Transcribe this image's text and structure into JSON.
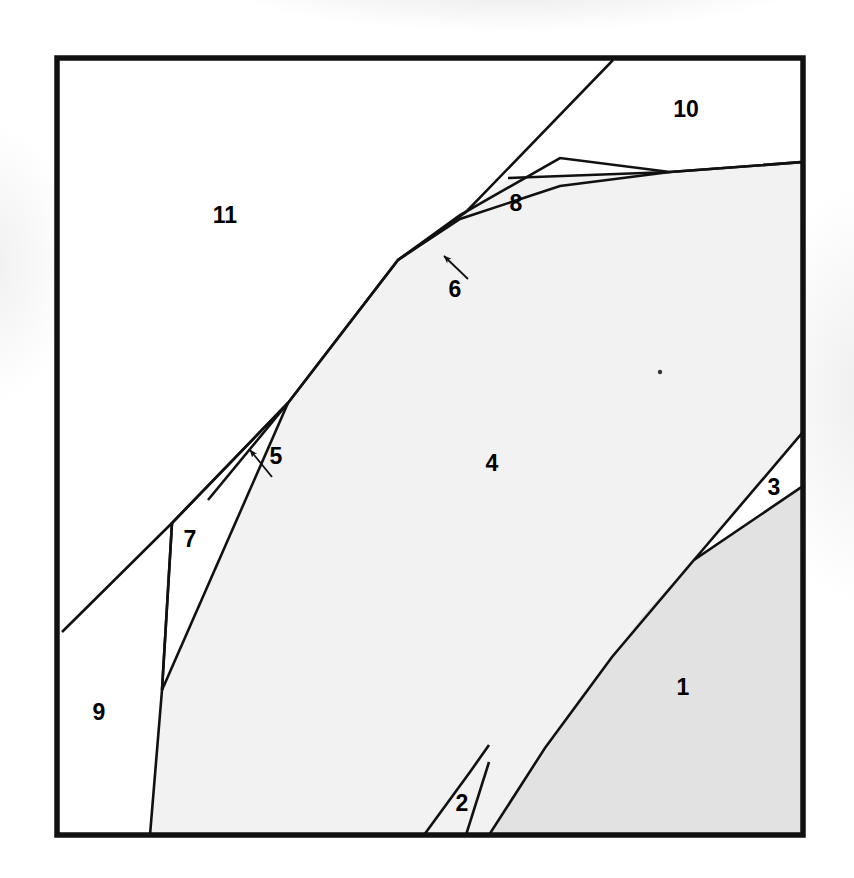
{
  "figure": {
    "type": "region-partition-diagram",
    "background_color": "#ffffff",
    "frame": {
      "x": 57,
      "y": 58,
      "width": 746,
      "height": 777,
      "stroke_color": "#111111",
      "stroke_width": 5.5
    },
    "fill_colors": {
      "white": "#ffffff",
      "light_gray": "#f2f2f2",
      "mid_gray": "#e2e2e2"
    },
    "line_color": "#111111"
  },
  "regions": [
    {
      "id": "region-1",
      "label": "1",
      "label_x": 683,
      "label_y": 689,
      "fill": "mid_gray",
      "has_leader": false
    },
    {
      "id": "region-2",
      "label": "2",
      "label_x": 462,
      "label_y": 805,
      "fill": "light_gray",
      "has_leader": false
    },
    {
      "id": "region-3",
      "label": "3",
      "label_x": 774,
      "label_y": 489,
      "fill": "white",
      "has_leader": false
    },
    {
      "id": "region-4",
      "label": "4",
      "label_x": 492,
      "label_y": 465,
      "fill": "light_gray",
      "has_leader": false
    },
    {
      "id": "region-5",
      "label": "5",
      "label_x": 272,
      "label_y": 458,
      "fill": "white",
      "has_leader": true
    },
    {
      "id": "region-6",
      "label": "6",
      "label_x": 455,
      "label_y": 290,
      "fill": "white",
      "has_leader": true
    },
    {
      "id": "region-7",
      "label": "7",
      "label_x": 190,
      "label_y": 541,
      "fill": "white",
      "has_leader": false
    },
    {
      "id": "region-8",
      "label": "8",
      "label_x": 516,
      "label_y": 205,
      "fill": "white",
      "has_leader": false
    },
    {
      "id": "region-9",
      "label": "9",
      "label_x": 99,
      "label_y": 714,
      "fill": "white",
      "has_leader": false
    },
    {
      "id": "region-10",
      "label": "10",
      "label_x": 686,
      "label_y": 111,
      "fill": "white",
      "has_leader": false
    },
    {
      "id": "region-11",
      "label": "11",
      "label_x": 225,
      "label_y": 217,
      "fill": "white",
      "has_leader": false
    }
  ],
  "leaders": [
    {
      "id": "leader-5",
      "x1": 271,
      "y1": 476,
      "x2": 246,
      "y2": 446,
      "arrow_angle": 230
    },
    {
      "id": "leader-6",
      "x1": 466,
      "y1": 277,
      "x2": 441,
      "y2": 253,
      "arrow_angle": 224
    }
  ],
  "shapes": {
    "area_4_path": "M 288 403 L 398 260 L 410 250 L 508 178 L 560 158 L 670 172 L 803 162 L 803 486 L 795 486 L 694 560 L 644 614 L 580 700 L 489 835 L 150 835 L 162 690 L 172 523 Z",
    "area_1_path": "M 694 560 L 803 486 L 803 835 L 489 835 L 580 700 L 644 614 Z",
    "area_2_path": "M 424 835 L 489 835 L 487 833 L 466 757 Z",
    "main_boundary_path": "M 150 835 L 162 690 L 172 523 L 288 403 L 398 260 L 560 158 L 670 172 L 803 162",
    "ridge_upper_path": "M 398 260 L 508 178 L 613 62",
    "ridge_8_top_path": "M 508 178 L 670 172 L 803 162",
    "sliver_5_path": "M 288 403 L 208 500 L 234 467 L 252 438 Z",
    "sliver_6_path": "M 398 260 L 508 178 L 430 243 Z",
    "region_7_left_path": "M 172 523 L 162 690",
    "region_7_outer_path": "M 62 632 L 172 523 L 288 403",
    "lower_7_path": "M 162 690 L 150 835",
    "region_3_top_path": "M 694 560 L 803 432",
    "region_3_bot_path": "M 694 560 L 803 486",
    "region_2_left_path": "M 424 835 L 487 760",
    "region_2_right_path": "M 466 835 L 489 790",
    "curve_1_3_path": "M 489 835 L 580 700 L 644 614 L 694 560"
  },
  "dot_marker": {
    "x": 660,
    "y": 372,
    "r": 2.2
  }
}
